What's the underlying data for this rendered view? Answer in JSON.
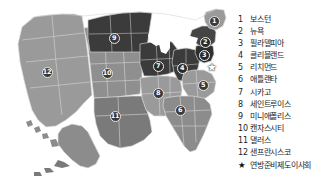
{
  "figure": {
    "background_color": "#ffffff",
    "map_colors": {
      "light_region": "#9a9a9a",
      "dark_region": "#3b3b3b",
      "mid_region": "#6e6e6e",
      "border": "#d9d9d9",
      "marker_fill": "#2a2a2a",
      "marker_text": "#ffffff",
      "legend_text": "#1d1d1d"
    }
  },
  "map": {
    "title": "",
    "markers": [
      {
        "id": "1",
        "label": "1",
        "x": 214,
        "y": 21,
        "shade": "light"
      },
      {
        "id": "2",
        "label": "2",
        "x": 205,
        "y": 42,
        "shade": "dark"
      },
      {
        "id": "3",
        "label": "3",
        "x": 204,
        "y": 55,
        "shade": "dark"
      },
      {
        "id": "4",
        "label": "4",
        "x": 182,
        "y": 68,
        "shade": "dark"
      },
      {
        "id": "5",
        "label": "5",
        "x": 203,
        "y": 85,
        "shade": "light"
      },
      {
        "id": "6",
        "label": "6",
        "x": 180,
        "y": 110,
        "shade": "light"
      },
      {
        "id": "7",
        "label": "7",
        "x": 158,
        "y": 66,
        "shade": "dark"
      },
      {
        "id": "8",
        "label": "8",
        "x": 158,
        "y": 93,
        "shade": "light"
      },
      {
        "id": "9",
        "label": "9",
        "x": 114,
        "y": 38,
        "shade": "light"
      },
      {
        "id": "10",
        "label": "10",
        "x": 107,
        "y": 73,
        "shade": "light"
      },
      {
        "id": "11",
        "label": "11",
        "x": 115,
        "y": 116,
        "shade": "light"
      },
      {
        "id": "12",
        "label": "12",
        "x": 47,
        "y": 72,
        "shade": "light"
      }
    ],
    "board_marker": {
      "symbol": "★",
      "x": 212,
      "y": 68
    }
  },
  "legend": {
    "items": [
      {
        "num": "1",
        "label": "보스턴"
      },
      {
        "num": "2",
        "label": "뉴욕"
      },
      {
        "num": "3",
        "label": "필라델피아"
      },
      {
        "num": "4",
        "label": "클리블랜드"
      },
      {
        "num": "5",
        "label": "리치먼드"
      },
      {
        "num": "6",
        "label": "애틀랜타"
      },
      {
        "num": "7",
        "label": "시카고"
      },
      {
        "num": "8",
        "label": "세인트루이스"
      },
      {
        "num": "9",
        "label": "미니애폴리스"
      },
      {
        "num": "10",
        "label": "캔자스시티"
      },
      {
        "num": "11",
        "label": "댈러스"
      },
      {
        "num": "12",
        "label": "샌프란시스코"
      }
    ],
    "board_entry": {
      "num": "★",
      "label": "연방준비제도이사회"
    }
  }
}
